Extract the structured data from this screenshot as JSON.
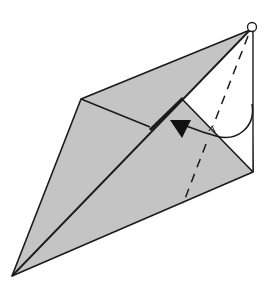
{
  "diagram": {
    "type": "origami-fold-step",
    "description": "Kite-shaped folded paper with a flap being swivel-folded toward the centre diagonal",
    "colors": {
      "paper_shaded": "#c4c4c4",
      "paper_white": "#ffffff",
      "line": "#1a1a1a"
    },
    "symbols": [
      {
        "name": "pivot-circle",
        "meaning": "pivot point at top apex"
      },
      {
        "name": "valley-fold-dashed-line",
        "meaning": "valley fold line"
      },
      {
        "name": "fold-arrow",
        "meaning": "fold flap in direction of arrow"
      }
    ]
  }
}
